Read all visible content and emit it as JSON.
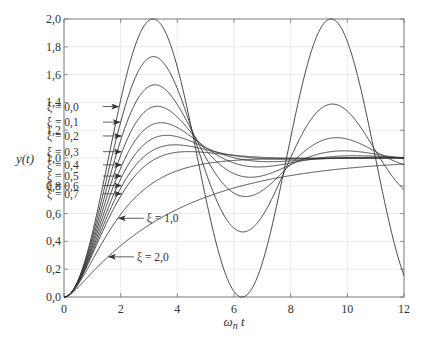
{
  "chart_data": {
    "type": "line",
    "title": "",
    "xlabel": "ω_n t",
    "ylabel": "y(t)",
    "xlim": [
      0,
      12
    ],
    "ylim": [
      0,
      2.0
    ],
    "grid": true,
    "legend": "inline arrow annotations",
    "x_ticks": [
      "0",
      "2",
      "4",
      "6",
      "8",
      "10",
      "12"
    ],
    "y_ticks": [
      "0,0",
      "0,2",
      "0,4",
      "0,6",
      "0,8",
      "1,0",
      "1,2",
      "1,4",
      "1,6",
      "1,8",
      "2,0"
    ],
    "series": [
      {
        "name": "ξ = 0,0",
        "zeta": 0.0,
        "peak": 2.0,
        "peak_t": 3.14
      },
      {
        "name": "ξ = 0,1",
        "zeta": 0.1,
        "peak": 1.73,
        "peak_t": 3.16
      },
      {
        "name": "ξ = 0,2",
        "zeta": 0.2,
        "peak": 1.53,
        "peak_t": 3.21
      },
      {
        "name": "ξ = 0,3",
        "zeta": 0.3,
        "peak": 1.37,
        "peak_t": 3.29
      },
      {
        "name": "ξ = 0,4",
        "zeta": 0.4,
        "peak": 1.25,
        "peak_t": 3.43
      },
      {
        "name": "ξ = 0,5",
        "zeta": 0.5,
        "peak": 1.16,
        "peak_t": 3.63
      },
      {
        "name": "ξ = 0,6",
        "zeta": 0.6,
        "peak": 1.09,
        "peak_t": 3.93
      },
      {
        "name": "ξ = 0,7",
        "zeta": 0.7,
        "peak": 1.05,
        "peak_t": 4.4
      },
      {
        "name": "ξ = 1,0",
        "zeta": 1.0,
        "peak": 1.0,
        "peak_t": null
      },
      {
        "name": "ξ = 2,0",
        "zeta": 2.0,
        "peak": 0.96,
        "peak_t": null
      }
    ]
  },
  "annotations": [
    {
      "label": "ξ = 0,0",
      "text_x": 5,
      "text_y": 1.89,
      "arrow_to_t": 1.95,
      "side": "left"
    },
    {
      "label": "ξ = 0,1",
      "text_x": 5,
      "text_y": 1.69,
      "arrow_to_t": 2.0,
      "side": "left"
    },
    {
      "label": "ξ = 0,2",
      "text_x": 5,
      "text_y": 1.49,
      "arrow_to_t": 2.05,
      "side": "left"
    },
    {
      "label": "ξ = 0,3",
      "text_x": 5,
      "text_y": 1.3,
      "arrow_to_t": 2.05,
      "side": "left"
    },
    {
      "label": "ξ = 0,4",
      "text_x": 5,
      "text_y": 1.14,
      "arrow_to_t": 2.05,
      "side": "left"
    },
    {
      "label": "ξ = 0,5",
      "text_x": 5,
      "text_y": 1.05,
      "arrow_to_t": 2.05,
      "side": "left"
    },
    {
      "label": "ξ = 0,6",
      "text_x": 5,
      "text_y": 0.96,
      "arrow_to_t": 2.05,
      "side": "left"
    },
    {
      "label": "ξ = 0,7",
      "text_x": 5,
      "text_y": 0.87,
      "arrow_to_t": 2.05,
      "side": "left"
    },
    {
      "label": "ξ = 1,0",
      "arrow_to_t": 1.9,
      "side": "right"
    },
    {
      "label": "ξ = 2,0",
      "arrow_to_t": 1.55,
      "side": "right"
    }
  ],
  "colors": {
    "curve": "#333333",
    "grid": "#e6e6e6",
    "axis": "#777777",
    "text": "#333333"
  }
}
